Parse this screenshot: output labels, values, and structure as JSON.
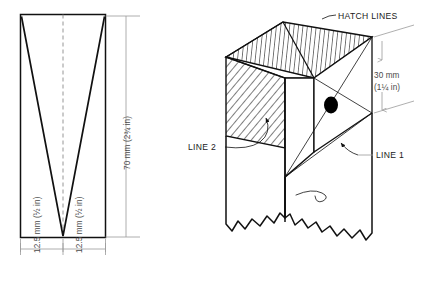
{
  "figure": {
    "background_color": "#ffffff",
    "line_color": "#111111",
    "dimension_color": "#9a9a9a",
    "marker_color": "#000000"
  },
  "left_diagram": {
    "name": "flat-pattern-template",
    "vertical_dimension": {
      "metric": "70 mm",
      "imperial": "(2¾ in)",
      "full_label": "70 mm (2¾ in)"
    },
    "horizontal_dimensions": [
      {
        "metric": "12.5 mm",
        "imperial": "(½ in)",
        "full_label": "12.5 mm (½ in)"
      },
      {
        "metric": "12.5 mm",
        "imperial": "(½ in)",
        "full_label": "12.5 mm (½ in)"
      }
    ]
  },
  "right_diagram": {
    "name": "isometric-block",
    "callouts": [
      {
        "id": "hatch-lines",
        "label": "HATCH LINES"
      },
      {
        "id": "line-1",
        "label": "LINE 1"
      },
      {
        "id": "line-2",
        "label": "LINE 2"
      }
    ],
    "vertical_dimension": {
      "metric": "30 mm",
      "imperial": "(1¼ in)",
      "full_label": "30 mm (1¼ in)"
    }
  }
}
